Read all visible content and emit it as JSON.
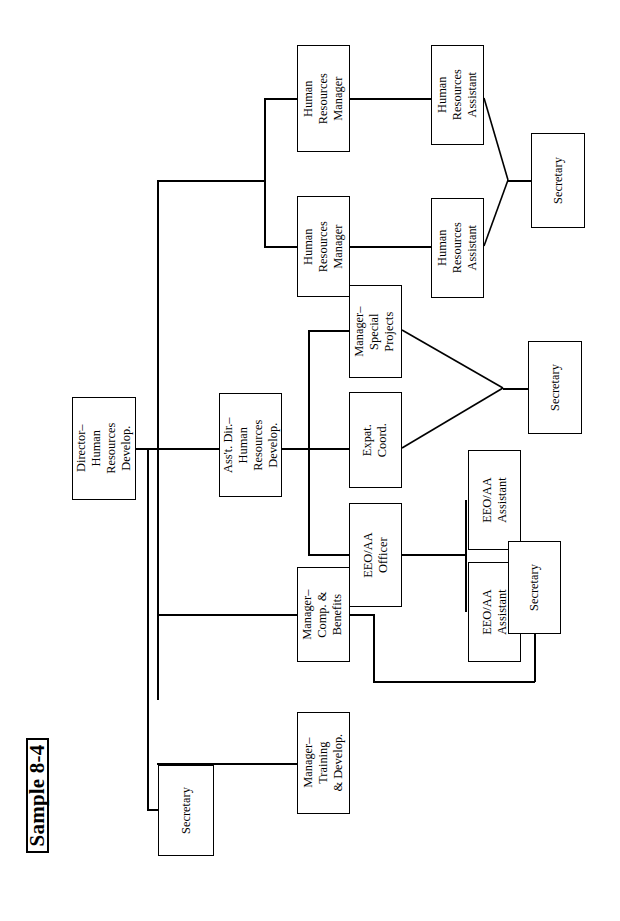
{
  "document": {
    "title": "Sample 8-4",
    "type": "organization-chart",
    "orientation": "rotated-90-counterclockwise",
    "page_size": {
      "width": 620,
      "height": 921
    },
    "stroke_color": "#000000",
    "background_color": "#ffffff"
  },
  "title_block": {
    "label": "Sample 8-4"
  },
  "nodes": [
    {
      "id": "director",
      "label": "Director–\nHuman\nResources\nDevelop.",
      "x": 72,
      "y": 397,
      "w": 64,
      "h": 103
    },
    {
      "id": "secretary_dir",
      "label": "Secretary",
      "x": 158,
      "y": 765,
      "w": 56,
      "h": 91
    },
    {
      "id": "asst_director",
      "label": "Ass't. Dir.–\nHuman\nResources\nDevelop.",
      "x": 219,
      "y": 393,
      "w": 63,
      "h": 104
    },
    {
      "id": "hr_manager_1",
      "label": "Human\nResources\nManager",
      "x": 297,
      "y": 45,
      "w": 53,
      "h": 107
    },
    {
      "id": "hr_manager_2",
      "label": "Human\nResources\nManager",
      "x": 297,
      "y": 196,
      "w": 53,
      "h": 101
    },
    {
      "id": "hr_asst_1",
      "label": "Human\nResources\nAssistant",
      "x": 431,
      "y": 45,
      "w": 53,
      "h": 100
    },
    {
      "id": "hr_asst_2",
      "label": "Human\nResources\nAssistant",
      "x": 431,
      "y": 198,
      "w": 53,
      "h": 100
    },
    {
      "id": "secretary_hr",
      "label": "Secretary",
      "x": 531,
      "y": 133,
      "w": 54,
      "h": 95
    },
    {
      "id": "mgr_special",
      "label": "Manager–\nSpecial\nProjects",
      "x": 349,
      "y": 285,
      "w": 53,
      "h": 93
    },
    {
      "id": "expat_coord",
      "label": "Expat.\nCoord.",
      "x": 349,
      "y": 392,
      "w": 53,
      "h": 96
    },
    {
      "id": "secretary_exp",
      "label": "Secretary",
      "x": 528,
      "y": 341,
      "w": 54,
      "h": 93
    },
    {
      "id": "eeo_officer",
      "label": "EEO/AA\nOfficer",
      "x": 349,
      "y": 503,
      "w": 53,
      "h": 104
    },
    {
      "id": "eeo_asst_1",
      "label": "EEO/AA\nAssistant",
      "x": 468,
      "y": 450,
      "w": 53,
      "h": 100
    },
    {
      "id": "eeo_asst_2",
      "label": "EEO/AA\nAssistant",
      "x": 468,
      "y": 562,
      "w": 53,
      "h": 100
    },
    {
      "id": "secretary_eeo",
      "label": "Secretary",
      "x": 508,
      "y": 541,
      "w": 53,
      "h": 93
    },
    {
      "id": "mgr_comp",
      "label": "Manager–\nComp. &\nBenefits",
      "x": 297,
      "y": 567,
      "w": 53,
      "h": 95
    },
    {
      "id": "mgr_training",
      "label": "Manager–\nTraining\n& Develop.",
      "x": 297,
      "y": 712,
      "w": 53,
      "h": 102
    }
  ],
  "hierarchy": {
    "root": "director",
    "edges": [
      {
        "from": "director",
        "to": "secretary_dir"
      },
      {
        "from": "director",
        "to": "asst_director"
      },
      {
        "from": "director",
        "to": "mgr_comp"
      },
      {
        "from": "director",
        "to": "mgr_training"
      },
      {
        "from": "director",
        "to": "hr_branch"
      },
      {
        "from": "hr_branch",
        "to": "hr_manager_1"
      },
      {
        "from": "hr_branch",
        "to": "hr_manager_2"
      },
      {
        "from": "hr_manager_1",
        "to": "hr_asst_1"
      },
      {
        "from": "hr_manager_2",
        "to": "hr_asst_2"
      },
      {
        "from": "hr_asst_1",
        "to": "secretary_hr"
      },
      {
        "from": "hr_asst_2",
        "to": "secretary_hr"
      },
      {
        "from": "asst_director",
        "to": "mgr_special"
      },
      {
        "from": "asst_director",
        "to": "expat_coord"
      },
      {
        "from": "asst_director",
        "to": "eeo_officer"
      },
      {
        "from": "mgr_special",
        "to": "secretary_exp"
      },
      {
        "from": "expat_coord",
        "to": "secretary_exp"
      },
      {
        "from": "eeo_officer",
        "to": "eeo_asst_1"
      },
      {
        "from": "eeo_officer",
        "to": "eeo_asst_2"
      },
      {
        "from": "mgr_comp",
        "to": "secretary_eeo"
      }
    ]
  },
  "connectors": {
    "orthogonal": [
      {
        "name": "director-stub-right",
        "o": "h",
        "x": 136,
        "y": 448,
        "len": 23
      },
      {
        "name": "director-trunk-vertical",
        "o": "v",
        "x": 157,
        "y": 180,
        "len": 520
      },
      {
        "name": "secretary-trunk-vertical",
        "o": "v",
        "x": 147,
        "y": 448,
        "len": 362
      },
      {
        "name": "secretary-stub",
        "o": "h",
        "x": 147,
        "y": 809,
        "len": 12
      },
      {
        "name": "asst-dir-branch",
        "o": "h",
        "x": 157,
        "y": 448,
        "len": 63
      },
      {
        "name": "hr-branch-feed",
        "o": "h",
        "x": 157,
        "y": 180,
        "len": 109
      },
      {
        "name": "hr-branch-vertical",
        "o": "v",
        "x": 264,
        "y": 98,
        "len": 150
      },
      {
        "name": "hr-mgr1-stub",
        "o": "h",
        "x": 264,
        "y": 98,
        "len": 34
      },
      {
        "name": "hr-mgr2-stub",
        "o": "h",
        "x": 264,
        "y": 246,
        "len": 34
      },
      {
        "name": "hr-mgr1-to-asst1",
        "o": "h",
        "x": 350,
        "y": 98,
        "len": 82
      },
      {
        "name": "hr-mgr2-to-asst2",
        "o": "h",
        "x": 350,
        "y": 246,
        "len": 82
      },
      {
        "name": "secretary-hr-stub",
        "o": "h",
        "x": 508,
        "y": 180,
        "len": 24
      },
      {
        "name": "asst-dir-out",
        "o": "h",
        "x": 282,
        "y": 448,
        "len": 27
      },
      {
        "name": "asst-dir-children-vert",
        "o": "v",
        "x": 308,
        "y": 330,
        "len": 225
      },
      {
        "name": "mgr-special-stub",
        "o": "h",
        "x": 308,
        "y": 330,
        "len": 42
      },
      {
        "name": "expat-coord-stub",
        "o": "h",
        "x": 308,
        "y": 448,
        "len": 42
      },
      {
        "name": "eeo-officer-stub",
        "o": "h",
        "x": 308,
        "y": 554,
        "len": 42
      },
      {
        "name": "secretary-exp-stub",
        "o": "h",
        "x": 503,
        "y": 388,
        "len": 26
      },
      {
        "name": "eeo-officer-out",
        "o": "h",
        "x": 402,
        "y": 554,
        "len": 64
      },
      {
        "name": "eeo-asst-vertical",
        "o": "v",
        "x": 465,
        "y": 500,
        "len": 112
      },
      {
        "name": "mgr-comp-stub-left",
        "o": "h",
        "x": 157,
        "y": 614,
        "len": 141
      },
      {
        "name": "mgr-training-stub-left",
        "o": "h",
        "x": 157,
        "y": 763,
        "len": 141
      },
      {
        "name": "mgr-comp-out",
        "o": "h",
        "x": 350,
        "y": 614,
        "len": 24
      },
      {
        "name": "mgr-comp-sec-vert",
        "o": "v",
        "x": 373,
        "y": 614,
        "len": 68
      },
      {
        "name": "mgr-comp-sec-horiz",
        "o": "h",
        "x": 373,
        "y": 681,
        "len": 162
      },
      {
        "name": "secretary-eeo-stub",
        "o": "v",
        "x": 534,
        "y": 634,
        "len": 48
      }
    ],
    "diagonals": [
      {
        "name": "hr-asst1-to-secretary",
        "x1": 484,
        "y1": 98,
        "x2": 508,
        "y2": 180
      },
      {
        "name": "hr-asst2-to-secretary",
        "x1": 484,
        "y1": 246,
        "x2": 508,
        "y2": 180
      },
      {
        "name": "mgr-special-to-sec",
        "x1": 402,
        "y1": 330,
        "x2": 503,
        "y2": 388
      },
      {
        "name": "expat-coord-to-sec",
        "x1": 402,
        "y1": 448,
        "x2": 503,
        "y2": 388
      }
    ]
  }
}
